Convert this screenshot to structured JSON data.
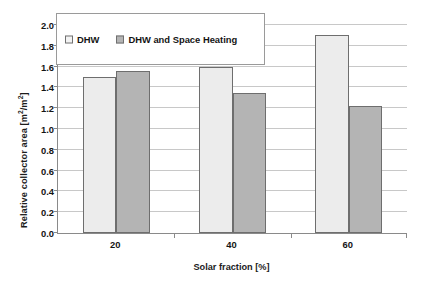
{
  "chart_data": {
    "type": "bar",
    "title": "",
    "subtitle": "",
    "xlabel": "Solar fraction [%]",
    "ylabel": "Relative collector area  [m²/m²]",
    "ylabel_parts": {
      "text_main": "Relative collector area  [m",
      "sup1": "2",
      "text_mid": "/m",
      "sup2": "2",
      "text_end": "]"
    },
    "categories": [
      "20",
      "40",
      "60"
    ],
    "series": [
      {
        "name": "DHW",
        "values": [
          1.5,
          1.6,
          1.9
        ],
        "color": "#ececec"
      },
      {
        "name": "DHW and Space Heating",
        "values": [
          1.56,
          1.35,
          1.22
        ],
        "color": "#b4b4b4"
      }
    ],
    "ylim": [
      0.0,
      2.0
    ],
    "ytick_values": [
      0.0,
      0.2,
      0.4,
      0.6,
      0.8,
      1.0,
      1.2,
      1.4,
      1.6,
      1.8,
      2.0
    ],
    "ytick_labels": [
      "0.0",
      "0.2",
      "0.4",
      "0.6",
      "0.8",
      "1.0",
      "1.2",
      "1.4",
      "1.6",
      "1.8",
      "2.0"
    ],
    "grid": true,
    "grid_axis": "y",
    "legend_position": "upper-left",
    "bar_border_color": "#6e6e6e",
    "axis_color": "#8a8a8a",
    "gridline_color": "#c8c8c8",
    "background": "#ffffff"
  },
  "legend": {
    "items": [
      {
        "label": "DHW",
        "color": "#f3f3f3"
      },
      {
        "label": "DHW and Space Heating",
        "color": "#b4b4b4"
      }
    ]
  },
  "axes": {
    "x_title": "Solar fraction [%]",
    "x_tick_labels": [
      "20",
      "40",
      "60"
    ],
    "y_tick_labels": [
      "2.0",
      "1.8",
      "1.6",
      "1.4",
      "1.2",
      "1.0",
      "0.8",
      "0.6",
      "0.4",
      "0.2",
      "0.0"
    ]
  }
}
